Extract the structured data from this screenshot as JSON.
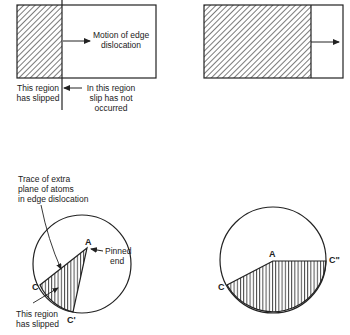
{
  "panels": {
    "top_left": {
      "motion_label": [
        "Motion of edge",
        "dislocation"
      ],
      "slipped_label": [
        "This region",
        "has slipped"
      ],
      "not_slipped_label": [
        "In this region",
        "slip has not",
        "occurred"
      ]
    },
    "top_right": {},
    "bottom_left": {
      "trace_label": [
        "Trace of extra",
        "plane of atoms",
        "in edge dislocation"
      ],
      "pinned_label": [
        "Pinned",
        "end"
      ],
      "slipped_label": [
        "This region",
        "has slipped"
      ],
      "points": {
        "A": "A",
        "C": "C",
        "C_prime": "C'"
      }
    },
    "bottom_right": {
      "points": {
        "A": "A",
        "C": "C",
        "C_double_prime": "C\""
      }
    }
  },
  "colors": {
    "ink": "#222222",
    "background": "#ffffff"
  }
}
